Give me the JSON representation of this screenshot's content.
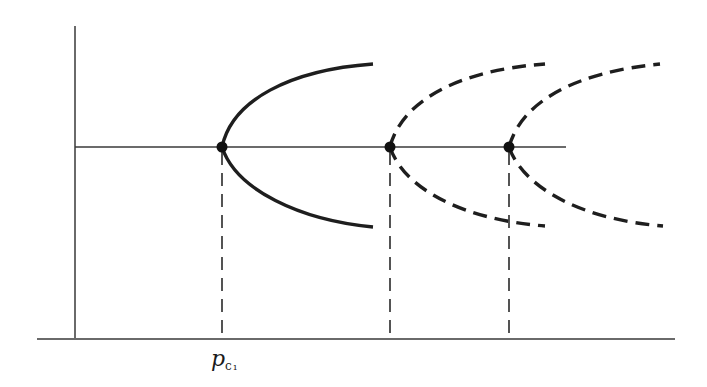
{
  "diagram": {
    "type": "pitchfork bifurcation diagram",
    "vertical_axis": {
      "x": 75,
      "y_top": 26,
      "y_bottom": 339
    },
    "horizontal_axis": {
      "y": 339,
      "x_left": 37,
      "x_right": 675
    },
    "trivial_branch": {
      "y": 147,
      "x_left": 75,
      "x_right": 566
    },
    "bifurcations": [
      {
        "id": "b1",
        "x": 222,
        "y": 147,
        "branch_style": "solid",
        "upper_end": [
          373,
          64
        ],
        "lower_end": [
          373,
          227
        ],
        "label": "p",
        "label_subscript": "c₁"
      },
      {
        "id": "b2",
        "x": 390,
        "y": 147,
        "branch_style": "dashed",
        "upper_end": [
          545,
          64
        ],
        "lower_end": [
          545,
          226
        ],
        "label": "",
        "label_subscript": ""
      },
      {
        "id": "b3",
        "x": 509,
        "y": 147,
        "branch_style": "dashed",
        "upper_end": [
          660,
          64
        ],
        "lower_end": [
          663,
          226
        ],
        "label": "",
        "label_subscript": ""
      }
    ],
    "labels": {
      "critical_point_1": {
        "main": "p",
        "subscript": "c₁"
      }
    },
    "colors": {
      "ink": "#1e1e1e",
      "axis": "#6a6a6a",
      "background": "#ffffff"
    }
  }
}
